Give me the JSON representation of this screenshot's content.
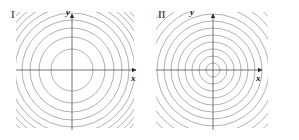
{
  "figure": {
    "width": 299,
    "height": 140,
    "background": "#ffffff",
    "line_color": "#6e6e6e",
    "axis_color": "#3a3a3a",
    "text_color": "#111111"
  },
  "panels": [
    {
      "id": "panel-1",
      "label": "I",
      "axes": {
        "y_label": "y",
        "x_label": "x",
        "origin_x": 72,
        "origin_y": 70,
        "x_min": 16,
        "x_max": 138,
        "y_min": 12,
        "y_max": 130
      },
      "clip": {
        "x": 16,
        "y": 12,
        "width": 118,
        "height": 116
      },
      "contour_radii": [
        21,
        33,
        42,
        50,
        57,
        63,
        68.5,
        73.5,
        78,
        82,
        86,
        89.5,
        93,
        96,
        99
      ]
    },
    {
      "id": "panel-2",
      "label": "II",
      "axes": {
        "y_label": "y",
        "x_label": "x",
        "origin_x": 63,
        "origin_y": 70,
        "x_min": 6,
        "x_max": 118,
        "y_min": 12,
        "y_max": 130
      },
      "clip": {
        "x": 6,
        "y": 12,
        "width": 112,
        "height": 116
      },
      "contour_radii": [
        7,
        14,
        21,
        28,
        35,
        42,
        49,
        56,
        63,
        70,
        77,
        84,
        91
      ]
    }
  ],
  "chart_data": {
    "type": "line",
    "title": "",
    "subtitle": "",
    "xlabel": "x",
    "ylabel": "y",
    "grid": false,
    "legend": "none",
    "panels": [
      {
        "name": "I",
        "label": "I",
        "type": "contour",
        "center": [
          0,
          0
        ],
        "level_curve_shape": "circle",
        "contour_count": 15,
        "contour_radii": [
          21,
          33,
          42,
          50,
          57,
          63,
          68.5,
          73.5,
          78,
          82,
          86,
          89.5,
          93,
          96,
          99
        ],
        "spacing": "decreasing outward (wide near center, crowded near edges)",
        "axis_labels": {
          "x": "x",
          "y": "y"
        }
      },
      {
        "name": "II",
        "label": "II",
        "type": "contour",
        "center": [
          0,
          0
        ],
        "level_curve_shape": "circle",
        "contour_count": 13,
        "contour_radii": [
          7,
          14,
          21,
          28,
          35,
          42,
          49,
          56,
          63,
          70,
          77,
          84,
          91
        ],
        "spacing": "uniform (equally spaced rings)",
        "axis_labels": {
          "x": "x",
          "y": "y"
        }
      }
    ]
  }
}
